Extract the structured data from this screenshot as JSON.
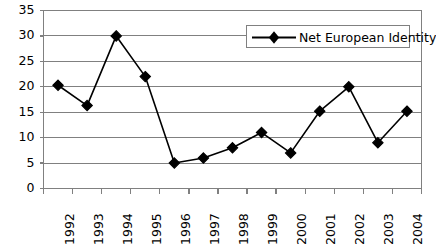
{
  "chart_data": {
    "type": "line",
    "title": "",
    "subtitle": "",
    "xlabel": "",
    "ylabel": "",
    "categories": [
      "1992",
      "1993",
      "1994",
      "1995",
      "1996",
      "1997",
      "1998",
      "1999",
      "2000",
      "2001",
      "2002",
      "2003",
      "2004"
    ],
    "series": [
      {
        "name": "Net European Identity",
        "values": [
          20.3,
          16.3,
          30.0,
          22.0,
          5.0,
          6.0,
          8.0,
          11.0,
          7.0,
          15.2,
          20.0,
          9.0,
          15.2
        ],
        "color": "#000000",
        "marker": "diamond"
      }
    ],
    "ylim": [
      0,
      35
    ],
    "yticks": [
      0,
      5,
      10,
      15,
      20,
      25,
      30,
      35
    ],
    "ytick_labels": [
      "0",
      "5",
      "10",
      "15",
      "20",
      "25",
      "30",
      "35"
    ],
    "grid": {
      "horizontal": true,
      "vertical": false,
      "color": "#808080"
    },
    "legend": {
      "position": "top-right",
      "entries": [
        "Net European Identity"
      ],
      "border_color": "#808080",
      "background": "#ffffff"
    },
    "axes": {
      "line_color": "#808080",
      "tick_color": "#808080",
      "plot_background": "#ffffff",
      "x_label_rotation": 90
    }
  }
}
